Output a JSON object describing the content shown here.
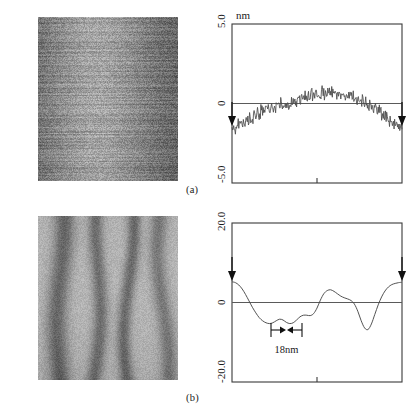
{
  "figure": {
    "panels": [
      {
        "id": "a",
        "caption": "(a)",
        "image": {
          "name": "afm-image-smooth-surface",
          "texture": "horizontal-scanlines",
          "description": "fine grained AFM topography with horizontal scan lines, bright band near centre"
        }
      },
      {
        "id": "b",
        "caption": "(b)",
        "image": {
          "name": "afm-image-grooved-surface",
          "texture": "vertical-stripes",
          "description": "AFM topography showing broad vertical grooves and ridges"
        }
      }
    ]
  },
  "chart_data": [
    {
      "type": "line",
      "id": "profile-a",
      "title": "",
      "unit_label": "nm",
      "ylabel": "nm",
      "xlabel": "",
      "ylim": [
        -5.0,
        5.0
      ],
      "yticks": [
        5.0,
        0,
        -5.0
      ],
      "ytick_labels": [
        "5.0",
        "0",
        "-5.0"
      ],
      "xlim": [
        0,
        100
      ],
      "grid": false,
      "zero_line": true,
      "legend": "none",
      "edge_markers": [
        "left-down-arrow",
        "right-down-arrow"
      ],
      "x": [
        0,
        1,
        2,
        3,
        4,
        5,
        6,
        7,
        8,
        9,
        10,
        11,
        12,
        13,
        14,
        15,
        16,
        17,
        18,
        19,
        20,
        21,
        22,
        23,
        24,
        25,
        26,
        27,
        28,
        29,
        30,
        31,
        32,
        33,
        34,
        35,
        36,
        37,
        38,
        39,
        40,
        41,
        42,
        43,
        44,
        45,
        46,
        47,
        48,
        49,
        50,
        51,
        52,
        53,
        54,
        55,
        56,
        57,
        58,
        59,
        60,
        61,
        62,
        63,
        64,
        65,
        66,
        67,
        68,
        69,
        70,
        71,
        72,
        73,
        74,
        75,
        76,
        77,
        78,
        79,
        80,
        81,
        82,
        83,
        84,
        85,
        86,
        87,
        88,
        89,
        90,
        91,
        92,
        93,
        94,
        95,
        96,
        97,
        98,
        99,
        100
      ],
      "values": [
        -1.55,
        -1.4,
        -1.62,
        -1.33,
        -1.5,
        -1.2,
        -1.38,
        -1.05,
        -1.22,
        -0.92,
        -1.1,
        -0.8,
        -0.98,
        -0.7,
        -0.88,
        -0.58,
        -0.76,
        -0.5,
        -0.66,
        -0.4,
        -0.58,
        -0.3,
        -0.48,
        -0.22,
        -0.4,
        -0.14,
        -0.32,
        -0.06,
        -0.25,
        0.02,
        -0.18,
        0.08,
        -0.12,
        0.14,
        -0.05,
        0.2,
        0.02,
        0.26,
        0.08,
        0.32,
        0.16,
        0.4,
        0.22,
        0.46,
        0.3,
        0.54,
        0.36,
        0.6,
        0.44,
        0.66,
        0.5,
        0.7,
        0.56,
        0.74,
        0.6,
        0.78,
        0.64,
        0.8,
        0.66,
        0.8,
        0.64,
        0.78,
        0.6,
        0.74,
        0.56,
        0.7,
        0.5,
        0.64,
        0.44,
        0.58,
        0.36,
        0.5,
        0.28,
        0.42,
        0.2,
        0.32,
        0.1,
        0.22,
        0.0,
        0.1,
        -0.12,
        -0.02,
        -0.26,
        -0.16,
        -0.42,
        -0.3,
        -0.58,
        -0.46,
        -0.76,
        -0.62,
        -0.94,
        -0.8,
        -1.12,
        -0.98,
        -1.28,
        -1.14,
        -1.42,
        -1.28,
        -1.55,
        -1.4,
        -1.62
      ]
    },
    {
      "type": "line",
      "id": "profile-b",
      "title": "",
      "unit_label": "",
      "ylabel": "nm",
      "xlabel": "",
      "ylim": [
        -20.0,
        20.0
      ],
      "yticks": [
        20.0,
        0,
        -20.0
      ],
      "ytick_labels": [
        "20.0",
        "0",
        "-20.0"
      ],
      "xlim": [
        0,
        100
      ],
      "grid": false,
      "zero_line": true,
      "legend": "none",
      "edge_markers": [
        "left-down-arrow",
        "right-down-arrow"
      ],
      "annotation": {
        "label": "18nm",
        "name": "width-measure-18nm",
        "x_start": 30,
        "x_end": 44,
        "y": -13.5
      },
      "x": [
        0,
        2,
        4,
        6,
        8,
        10,
        12,
        14,
        16,
        18,
        20,
        22,
        24,
        26,
        28,
        30,
        32,
        34,
        36,
        38,
        40,
        42,
        44,
        46,
        48,
        50,
        52,
        54,
        56,
        58,
        60,
        62,
        64,
        66,
        68,
        70,
        72,
        74,
        76,
        78,
        80,
        82,
        84,
        86,
        88,
        90,
        92,
        94,
        96,
        98,
        100
      ],
      "values": [
        5.2,
        5.0,
        4.4,
        3.4,
        2.0,
        0.4,
        -1.2,
        -2.6,
        -3.8,
        -4.6,
        -5.1,
        -5.3,
        -5.1,
        -4.6,
        -4.2,
        -4.4,
        -5.0,
        -5.3,
        -5.1,
        -4.4,
        -3.6,
        -3.2,
        -3.2,
        -3.3,
        -2.8,
        -1.4,
        0.6,
        2.2,
        3.0,
        3.2,
        2.8,
        2.2,
        1.6,
        1.2,
        0.9,
        0.5,
        -0.4,
        -2.2,
        -4.6,
        -6.4,
        -6.8,
        -5.4,
        -3.0,
        -0.6,
        1.4,
        2.9,
        3.9,
        4.5,
        4.8,
        5.0,
        5.1
      ]
    }
  ]
}
